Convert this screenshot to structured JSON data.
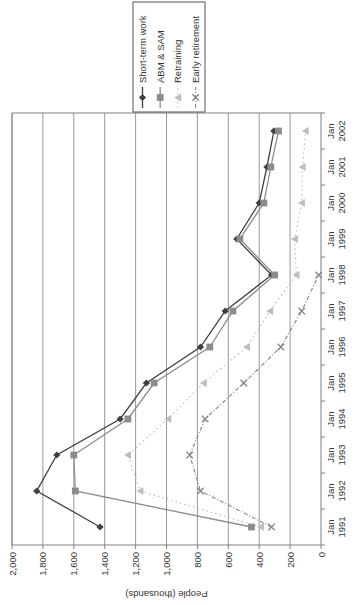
{
  "page": {
    "background_color": "#ffffff",
    "rotation": "chart rendered landscape then rotated 90 degrees counter-clockwise"
  },
  "chart_data": {
    "type": "line",
    "title": "",
    "xlabel": "",
    "ylabel": "People (thousands)",
    "ylim": [
      0,
      2000
    ],
    "ytick_step": 200,
    "ytick_labels": [
      "0",
      "200",
      "400",
      "600",
      "800",
      "1,000",
      "1,200",
      "1,400",
      "1,600",
      "1,800",
      "2,000"
    ],
    "grid": "value-gridlines-on",
    "legend_position": "right",
    "categories": [
      "Jan 1991",
      "Jan 1992",
      "Jan 1993",
      "Jan 1994",
      "Jan 1995",
      "Jan 1996",
      "Jan 1997",
      "Jan 1998",
      "Jan 1999",
      "Jan 2000",
      "Jan 2001",
      "Jan 2002"
    ],
    "series": [
      {
        "name": "Short-term work",
        "marker": "diamond",
        "line_style": "solid",
        "color": "#404040",
        "values": [
          1430,
          1840,
          1710,
          1300,
          1130,
          780,
          620,
          320,
          545,
          400,
          350,
          305
        ]
      },
      {
        "name": "ABM & SAM",
        "marker": "square",
        "line_style": "solid",
        "color": "#8c8c8c",
        "values": [
          450,
          1590,
          1600,
          1250,
          1080,
          720,
          570,
          300,
          525,
          370,
          325,
          275
        ]
      },
      {
        "name": "Retraining",
        "marker": "triangle",
        "line_style": "dotted",
        "color": "#bdbdbd",
        "values": [
          390,
          1170,
          1250,
          990,
          760,
          480,
          330,
          160,
          170,
          125,
          120,
          100
        ]
      },
      {
        "name": "Early retirement",
        "marker": "x",
        "line_style": "dash-dot",
        "color": "#858585",
        "values": [
          320,
          780,
          850,
          750,
          500,
          260,
          125,
          15,
          null,
          null,
          null,
          null
        ]
      }
    ]
  },
  "style": {
    "axis_color": "#808080",
    "grid_color": "#999999",
    "text_color": "#333333",
    "legend_border_color": "#555555",
    "plot_background": "#ffffff"
  }
}
